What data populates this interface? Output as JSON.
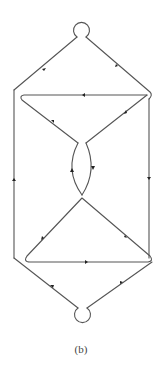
{
  "figure": {
    "caption": "(b)",
    "stroke_color": "#555555",
    "arrow_color": "#222222"
  },
  "nodes": [
    {
      "id": "top-loop",
      "x": 81,
      "y": 28,
      "r": 8
    },
    {
      "id": "bottom-loop",
      "x": 82,
      "y": 317,
      "r": 8
    }
  ],
  "edges": [
    {
      "id": "top-left-diagonal",
      "from": [
        77,
        37
      ],
      "to": [
        14,
        90
      ],
      "arrow": "down-left"
    },
    {
      "id": "top-right-diagonal",
      "from": [
        86,
        37
      ],
      "to": [
        150,
        92
      ],
      "arrow": "down-right"
    },
    {
      "id": "left-vertical",
      "from": [
        14,
        90
      ],
      "to": [
        14,
        258
      ],
      "arrow": "up"
    },
    {
      "id": "right-vertical",
      "from": [
        149,
        92
      ],
      "to": [
        149,
        258
      ],
      "arrow": "down"
    },
    {
      "id": "upper-triangle-top",
      "from": [
        147,
        95
      ],
      "to": [
        22,
        95
      ],
      "arrow": "left"
    },
    {
      "id": "upper-triangle-left",
      "from": [
        22,
        95
      ],
      "to": [
        78,
        143
      ],
      "arrow": "down-right"
    },
    {
      "id": "upper-triangle-right",
      "from": [
        86,
        143
      ],
      "to": [
        147,
        95
      ],
      "arrow": "up-right"
    },
    {
      "id": "lens-left",
      "from": [
        78,
        143
      ],
      "to": [
        82,
        195
      ],
      "arrow": "down"
    },
    {
      "id": "lens-right",
      "from": [
        82,
        195
      ],
      "to": [
        86,
        143
      ],
      "arrow": "up"
    },
    {
      "id": "lower-triangle-left",
      "from": [
        82,
        198
      ],
      "to": [
        25,
        262
      ],
      "arrow": "down-left"
    },
    {
      "id": "lower-triangle-right",
      "from": [
        82,
        198
      ],
      "to": [
        150,
        262
      ],
      "arrow": "down-right"
    },
    {
      "id": "lower-triangle-bottom",
      "from": [
        25,
        262
      ],
      "to": [
        148,
        262
      ],
      "arrow": "right"
    },
    {
      "id": "bottom-left-diagonal",
      "from": [
        14,
        258
      ],
      "to": [
        78,
        308
      ],
      "arrow": "down-right"
    },
    {
      "id": "bottom-right-diagonal",
      "from": [
        152,
        262
      ],
      "to": [
        87,
        308
      ],
      "arrow": "up-right"
    }
  ]
}
